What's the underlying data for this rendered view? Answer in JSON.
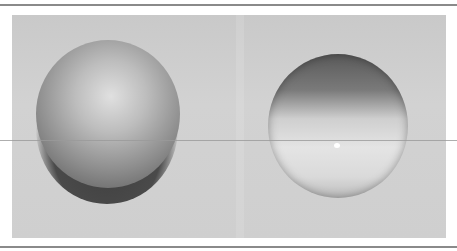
{
  "image": {
    "description": "Two shaded grayscale spheres on a light gray background",
    "objects": [
      {
        "name": "left-sphere",
        "shading": "lit from top, dark underside shadow"
      },
      {
        "name": "right-sphere",
        "shading": "dark top band, bright lower half with specular highlight"
      }
    ],
    "colors": {
      "background": "#ffffff",
      "photo_bg": "#cdcdcd",
      "border": "#8a8a8a"
    }
  }
}
